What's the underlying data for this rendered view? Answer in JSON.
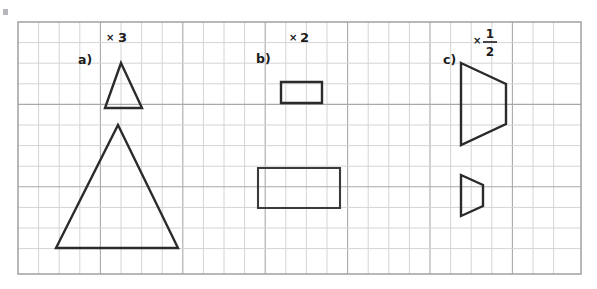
{
  "page": {
    "background_color": "#ffffff",
    "width": 597,
    "height": 289
  },
  "grid": {
    "name": "square-grid",
    "x": 18,
    "y": 22,
    "width": 563,
    "height": 252,
    "cell_size": 20.6,
    "cols": 27,
    "rows": 12,
    "line_color": "#cfcfd2",
    "major_line_color": "#a9a9ad",
    "border_color": "#9a9a9e",
    "major_every": 4
  },
  "corner_mark": {
    "name": "page-corner-mark",
    "x": 3,
    "y": 9,
    "width": 5,
    "height": 6,
    "color": "#b8b8bc"
  },
  "exercises": [
    {
      "id": "a",
      "label": "a)",
      "label_x": 78,
      "label_y": 64,
      "scale_factor": "3",
      "scale_type": "integer",
      "scale_label": "× 3",
      "mult_x": 106,
      "mult_y": 41,
      "factor_x": 118,
      "factor_y": 42,
      "original": {
        "name": "small-triangle",
        "type": "triangle",
        "points": "121,63 142,108 105,108",
        "cells_wide": 2,
        "cells_tall": 2
      },
      "scaled": {
        "name": "large-triangle",
        "type": "triangle",
        "points": "118,125 178,248 56,248",
        "cells_wide": 6,
        "cells_tall": 6
      }
    },
    {
      "id": "b",
      "label": "b)",
      "label_x": 256,
      "label_y": 63,
      "scale_factor": "2",
      "scale_type": "integer",
      "scale_label": "× 2",
      "mult_x": 289,
      "mult_y": 41,
      "factor_x": 300,
      "factor_y": 42,
      "original": {
        "name": "small-rectangle",
        "type": "rectangle",
        "points": "281,82 322,82 322,103 281,103",
        "cells_wide": 2,
        "cells_tall": 1
      },
      "scaled": {
        "name": "large-rectangle",
        "type": "rectangle",
        "points": "258,168 340,168 340,208 258,208",
        "cells_wide": 4,
        "cells_tall": 2
      }
    },
    {
      "id": "c",
      "label": "c)",
      "label_x": 443,
      "label_y": 64,
      "scale_factor": "1/2",
      "scale_type": "fraction",
      "scale_label": "× 1/2",
      "numerator": "1",
      "denominator": "2",
      "mult_x": 473,
      "mult_y": 44,
      "frac_x": 490,
      "frac_num_y": 38,
      "frac_den_y": 56,
      "frac_bar_x1": 483,
      "frac_bar_x2": 497,
      "frac_bar_y": 42,
      "original": {
        "name": "large-trapezoid",
        "type": "trapezoid",
        "points": "461,63 506,84 506,124 461,145",
        "cells_wide": 2,
        "cells_tall": 4
      },
      "scaled": {
        "name": "small-trapezoid",
        "type": "trapezoid",
        "points": "461,175 483,185 483,206 461,216",
        "cells_wide": 1,
        "cells_tall": 2
      }
    }
  ]
}
